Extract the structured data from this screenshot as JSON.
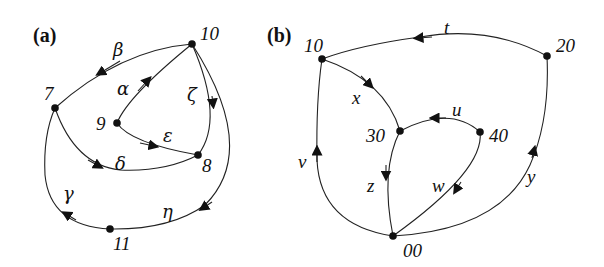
{
  "panels": {
    "a": {
      "label": "(a)",
      "nodes": {
        "n10": "10",
        "n7": "7",
        "n9": "9",
        "n8": "8",
        "n11": "11"
      },
      "edges": {
        "alpha": "α",
        "beta": "β",
        "gamma": "γ",
        "delta": "δ",
        "epsilon": "ε",
        "zeta": "ζ",
        "eta": "η"
      }
    },
    "b": {
      "label": "(b)",
      "nodes": {
        "n10": "10",
        "n20": "20",
        "n30": "30",
        "n40": "40",
        "n00": "00"
      },
      "edges": {
        "t": "t",
        "x": "x",
        "u": "u",
        "v": "v",
        "z": "z",
        "w": "w",
        "y": "y"
      }
    }
  },
  "colors": {
    "stroke": "#222222",
    "node": "#111111",
    "background": "#ffffff"
  }
}
